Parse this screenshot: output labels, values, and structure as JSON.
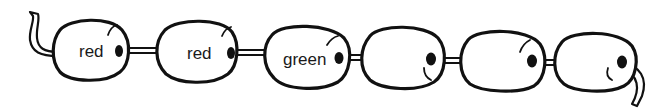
{
  "diagram": {
    "type": "bead-string",
    "colors": {
      "outline": "#111111",
      "fill": "#ffffff",
      "string_fill": "#ffffff"
    },
    "beads": [
      {
        "index": 1,
        "label": "red"
      },
      {
        "index": 2,
        "label": "red"
      },
      {
        "index": 3,
        "label": "green"
      },
      {
        "index": 4,
        "label": ""
      },
      {
        "index": 5,
        "label": ""
      },
      {
        "index": 6,
        "label": ""
      }
    ]
  }
}
